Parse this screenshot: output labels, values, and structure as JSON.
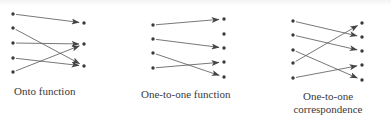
{
  "colors": {
    "ink": "#3a3a3a",
    "line": "#555555",
    "background": "#ffffff"
  },
  "diagrams": [
    {
      "id": "onto",
      "label_lines": [
        "Onto function"
      ],
      "label_pos": {
        "x": 14,
        "y": 85,
        "center": false
      },
      "left": [
        [
          13,
          14
        ],
        [
          13,
          28
        ],
        [
          13,
          43
        ],
        [
          13,
          58
        ],
        [
          13,
          72
        ]
      ],
      "right": [
        [
          84,
          23
        ],
        [
          84,
          44
        ],
        [
          84,
          66
        ]
      ],
      "arrows": [
        [
          0,
          0
        ],
        [
          1,
          2
        ],
        [
          2,
          1
        ],
        [
          3,
          2
        ],
        [
          4,
          1
        ]
      ]
    },
    {
      "id": "one-to-one",
      "label_lines": [
        "One-to-one function"
      ],
      "label_pos": {
        "x": 141,
        "y": 88,
        "center": false
      },
      "left": [
        [
          153,
          25
        ],
        [
          153,
          39
        ],
        [
          153,
          53
        ],
        [
          153,
          68
        ]
      ],
      "right": [
        [
          224,
          19
        ],
        [
          224,
          34
        ],
        [
          224,
          48
        ],
        [
          224,
          62
        ],
        [
          224,
          77
        ]
      ],
      "arrows": [
        [
          0,
          0
        ],
        [
          1,
          2
        ],
        [
          2,
          4
        ],
        [
          3,
          3
        ]
      ]
    },
    {
      "id": "correspondence",
      "label_lines": [
        "One-to-one",
        "correspondence"
      ],
      "label_pos": {
        "x": 328,
        "y": 90,
        "center": true
      },
      "left": [
        [
          293,
          21
        ],
        [
          293,
          35
        ],
        [
          293,
          50
        ],
        [
          293,
          63
        ],
        [
          293,
          78
        ]
      ],
      "right": [
        [
          362,
          23
        ],
        [
          362,
          37
        ],
        [
          362,
          51
        ],
        [
          362,
          65
        ],
        [
          362,
          80
        ]
      ],
      "arrows": [
        [
          0,
          1
        ],
        [
          1,
          2
        ],
        [
          2,
          4
        ],
        [
          3,
          0
        ],
        [
          4,
          3
        ]
      ]
    }
  ]
}
